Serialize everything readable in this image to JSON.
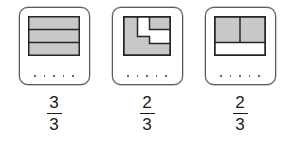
{
  "page": {
    "background_color": "#ffffff"
  },
  "style": {
    "shade_color": "#c8c8c8",
    "outline_color": "#262626",
    "card_border_color": "#5b5b5b",
    "dot_color": "#4a4a4a",
    "text_color": "#1a1a1a"
  },
  "cards": [
    {
      "id": "card-1",
      "figure_name": "three-horizontal-bars-all-shaded",
      "figure_description": "Rectangle divided into 3 equal horizontal bars, all shaded",
      "shaded_parts": 3,
      "total_parts": 3,
      "dots": 5,
      "fraction": {
        "numerator": "3",
        "denominator": "3"
      }
    },
    {
      "id": "card-2",
      "figure_name": "zigzag-two-thirds-shaded",
      "figure_description": "Rectangle with an irregular stair-step white region; remaining area shaded",
      "shaded_parts": 2,
      "total_parts": 3,
      "dots": 5,
      "fraction": {
        "numerator": "2",
        "denominator": "3"
      }
    },
    {
      "id": "card-3",
      "figure_name": "top-band-split-in-two-shaded",
      "figure_description": "Rectangle with top two-thirds shaded and split vertically in half; bottom third white",
      "shaded_parts": 2,
      "total_parts": 3,
      "dots": 5,
      "fraction": {
        "numerator": "2",
        "denominator": "3"
      }
    }
  ]
}
